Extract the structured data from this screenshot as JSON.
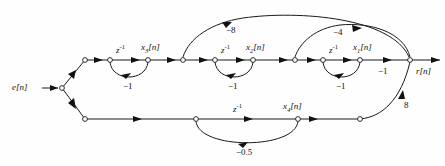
{
  "diagram": {
    "type": "signal flow graph",
    "input_label": "e[n]",
    "output_label": "r[n]",
    "delay_label": "z",
    "delay_exponent": "-1",
    "state_labels": {
      "x1": "x",
      "x1_sub": "1",
      "x1_idx": "[n]",
      "x2": "x",
      "x2_sub": "2",
      "x2_idx": "[n]",
      "x3": "x",
      "x3_sub": "3",
      "x3_idx": "[n]",
      "x4": "x",
      "x4_sub": "4",
      "x4_idx": "[n]"
    },
    "gains": {
      "outer_feedback": "−8",
      "inner_feedback": "−4",
      "loop_x3": "−1",
      "loop_x2": "−1",
      "loop_x1": "−1",
      "output_branch": "−1",
      "loop_x4": "−0.5",
      "bottom_to_output": "8"
    },
    "colors": {
      "ink": "#1a1a1a",
      "background": "#fefefe"
    }
  }
}
